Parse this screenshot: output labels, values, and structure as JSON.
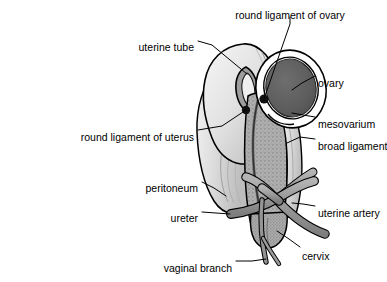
{
  "figure": {
    "type": "anatomical-illustration",
    "background": "#ffffff",
    "line_color": "#000000",
    "palette": {
      "outline": "#000000",
      "uterus_body": "#a8a8a8",
      "uterus_stipple": "#8e8e8e",
      "peritoneum_light": "#d8d8d8",
      "peritoneum_highlight": "#efefef",
      "ovary_fill": "#5e5e5e",
      "mesovarium_white": "#ffffff",
      "vessel_fill": "#9a9a9a",
      "cavity_dark": "#4a4a4a",
      "dot_black": "#101010"
    }
  },
  "labels": [
    {
      "id": "round-ligament-of-ovary",
      "text": "round ligament of ovary",
      "anchor_x": 290,
      "anchor_y": 10,
      "align": "center",
      "leader": [
        [
          290,
          17
        ],
        [
          290,
          24
        ],
        [
          264,
          99
        ]
      ]
    },
    {
      "id": "uterine-tube",
      "text": "uterine tube",
      "anchor_x": 194,
      "anchor_y": 42,
      "align": "right",
      "leader": [
        [
          198,
          41
        ],
        [
          212,
          45
        ],
        [
          247,
          74
        ]
      ]
    },
    {
      "id": "ovary",
      "text": "ovary",
      "anchor_x": 318,
      "anchor_y": 78,
      "align": "left",
      "leader": [
        [
          315,
          76
        ],
        [
          302,
          83
        ],
        [
          292,
          90
        ]
      ]
    },
    {
      "id": "mesovarium",
      "text": "mesovarium",
      "anchor_x": 318,
      "anchor_y": 119,
      "align": "left",
      "leader": [
        [
          315,
          117
        ],
        [
          303,
          115
        ],
        [
          292,
          113
        ]
      ]
    },
    {
      "id": "round-ligament-of-uterus",
      "text": "round ligament of uterus",
      "anchor_x": 194,
      "anchor_y": 132,
      "align": "right",
      "leader": [
        [
          198,
          130
        ],
        [
          222,
          126
        ],
        [
          246,
          110
        ]
      ]
    },
    {
      "id": "broad-ligament",
      "text": "broad ligament",
      "anchor_x": 318,
      "anchor_y": 141,
      "align": "left",
      "leader": [
        [
          315,
          139
        ],
        [
          300,
          137
        ],
        [
          287,
          143
        ]
      ]
    },
    {
      "id": "peritoneum",
      "text": "peritoneum",
      "anchor_x": 198,
      "anchor_y": 183,
      "align": "right",
      "leader": [
        [
          202,
          182
        ],
        [
          214,
          188
        ],
        [
          226,
          196
        ]
      ]
    },
    {
      "id": "ureter",
      "text": "ureter",
      "anchor_x": 198,
      "anchor_y": 213,
      "align": "right",
      "leader": [
        [
          202,
          212
        ],
        [
          216,
          213
        ],
        [
          230,
          214
        ]
      ]
    },
    {
      "id": "uterine-artery",
      "text": "uterine artery",
      "anchor_x": 318,
      "anchor_y": 208,
      "align": "left",
      "leader": [
        [
          315,
          206
        ],
        [
          303,
          204
        ],
        [
          292,
          203
        ]
      ]
    },
    {
      "id": "cervix",
      "text": "cervix",
      "anchor_x": 302,
      "anchor_y": 251,
      "align": "left",
      "leader": [
        [
          300,
          247
        ],
        [
          289,
          239
        ],
        [
          277,
          231
        ]
      ]
    },
    {
      "id": "vaginal-branch",
      "text": "vaginal branch",
      "anchor_x": 232,
      "anchor_y": 263,
      "align": "right",
      "leader": [
        [
          236,
          261
        ],
        [
          252,
          261
        ],
        [
          266,
          259
        ]
      ]
    }
  ]
}
